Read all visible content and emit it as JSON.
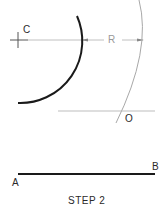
{
  "diagram": {
    "caption": "STEP 2",
    "labels": {
      "center": "C",
      "radius": "R",
      "point_o": "O",
      "point_a": "A",
      "point_b": "B"
    },
    "colors": {
      "dark_line": "#1a1a1a",
      "light_line": "#a8a8a8",
      "text": "#2a2a2a",
      "light_text": "#8a8a8a"
    }
  }
}
